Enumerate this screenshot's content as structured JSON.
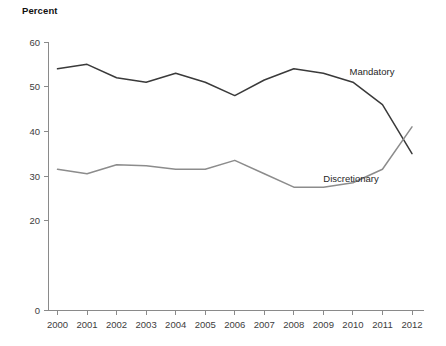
{
  "chart_data": {
    "type": "line",
    "title": "",
    "ylabel": "Percent",
    "xlabel": "",
    "ylim": [
      0,
      60
    ],
    "yticks": [
      0,
      20,
      30,
      40,
      50,
      60
    ],
    "ytick_labels": [
      "0",
      "20",
      "30",
      "40",
      "50",
      "60"
    ],
    "grid": false,
    "legend_position": "inline-annotation",
    "categories": [
      "2000",
      "2001",
      "2002",
      "2003",
      "2004",
      "2005",
      "2006",
      "2007",
      "2008",
      "2009",
      "2010",
      "2011",
      "2012"
    ],
    "x": [
      2000,
      2001,
      2002,
      2003,
      2004,
      2005,
      2006,
      2007,
      2008,
      2009,
      2010,
      2011,
      2012
    ],
    "series": [
      {
        "name": "Mandatory",
        "color": "#3a3a3a",
        "values": [
          54.0,
          55.0,
          52.0,
          51.0,
          53.0,
          51.0,
          48.0,
          51.5,
          54.0,
          53.0,
          51.0,
          46.0,
          35.0
        ]
      },
      {
        "name": "Discretionary",
        "color": "#8c8c8c",
        "values": [
          31.5,
          30.5,
          32.5,
          32.3,
          31.5,
          31.5,
          33.5,
          30.5,
          27.5,
          27.5,
          28.5,
          31.5,
          41.0
        ]
      }
    ],
    "annotations": [
      {
        "text": "Mandatory",
        "x_px": 372,
        "y_px": 75
      },
      {
        "text": "Discretionary",
        "x_px": 351,
        "y_px": 182
      }
    ]
  },
  "axis": {
    "y_title": "Percent"
  }
}
